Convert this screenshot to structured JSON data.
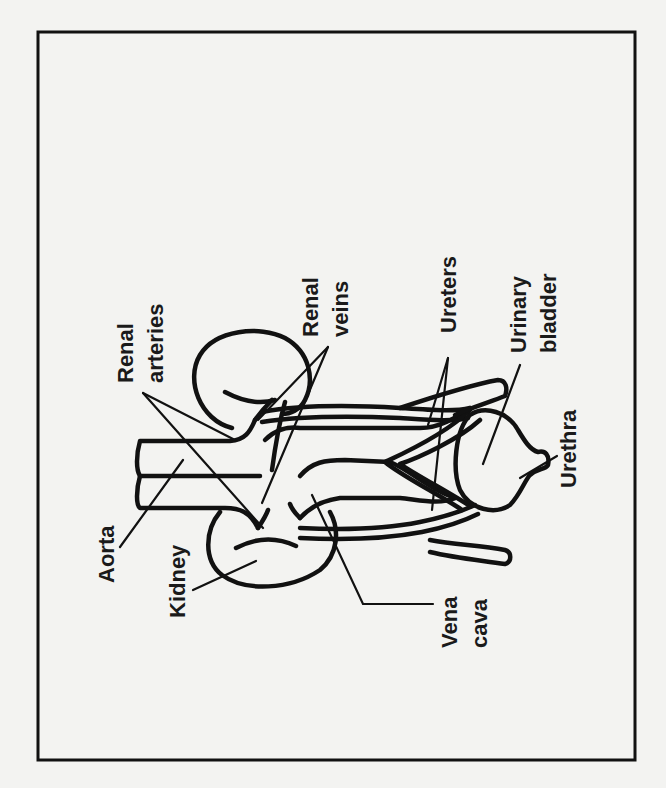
{
  "figure": {
    "orientation": "rotated 90 degrees counter-clockwise",
    "colors": {
      "ink": "#111111",
      "paper": "#f3f3f1"
    },
    "labels": {
      "renal_arteries": [
        "Renal",
        "arteries"
      ],
      "renal_veins": [
        "Renal",
        "veins"
      ],
      "ureters": [
        "Ureters"
      ],
      "urinary_bladder": [
        "Urinary",
        "bladder"
      ],
      "urethra": [
        "Urethra"
      ],
      "aorta": [
        "Aorta"
      ],
      "kidney": [
        "Kidney"
      ],
      "vena_cava": [
        "Vena",
        "cava"
      ]
    }
  }
}
